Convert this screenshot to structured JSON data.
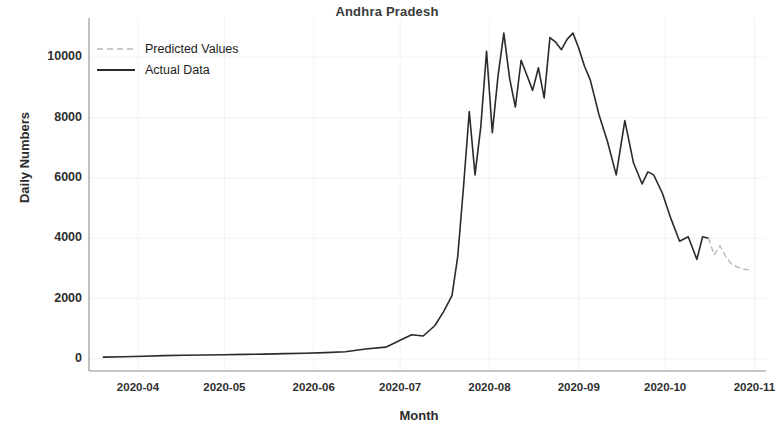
{
  "chart_data": {
    "type": "line",
    "title": "Andhra Pradesh",
    "xlabel": "Month",
    "ylabel": "Daily Numbers",
    "grid": true,
    "legend_position": "upper left",
    "ylim": [
      -400,
      11300
    ],
    "yticks": [
      0,
      2000,
      4000,
      6000,
      8000,
      10000
    ],
    "ytick_labels": [
      "0",
      "2000",
      "4000",
      "6000",
      "8000",
      "10000"
    ],
    "xlim": [
      "2020-03-15",
      "2020-11-05"
    ],
    "xticks": [
      "2020-04",
      "2020-05",
      "2020-06",
      "2020-07",
      "2020-08",
      "2020-09",
      "2020-10",
      "2020-11"
    ],
    "xtick_labels": [
      "2020-04",
      "2020-05",
      "2020-06",
      "2020-07",
      "2020-08",
      "2020-09",
      "2020-10",
      "2020-11"
    ],
    "colors": {
      "actual": "#2a2a2a",
      "predicted": "#b3b3b3",
      "axis": "#8d8d8d",
      "grid": "#f2f2f2"
    },
    "series": [
      {
        "name": "Actual Data",
        "style": "solid",
        "color": "#2a2a2a",
        "x": [
          "2020-03-20",
          "2020-03-27",
          "2020-04-03",
          "2020-04-10",
          "2020-04-17",
          "2020-04-24",
          "2020-05-01",
          "2020-05-08",
          "2020-05-15",
          "2020-05-22",
          "2020-05-29",
          "2020-06-05",
          "2020-06-12",
          "2020-06-19",
          "2020-06-26",
          "2020-07-01",
          "2020-07-05",
          "2020-07-09",
          "2020-07-13",
          "2020-07-16",
          "2020-07-19",
          "2020-07-21",
          "2020-07-23",
          "2020-07-25",
          "2020-07-27",
          "2020-07-29",
          "2020-07-31",
          "2020-08-02",
          "2020-08-04",
          "2020-08-06",
          "2020-08-08",
          "2020-08-10",
          "2020-08-12",
          "2020-08-14",
          "2020-08-16",
          "2020-08-18",
          "2020-08-20",
          "2020-08-22",
          "2020-08-24",
          "2020-08-26",
          "2020-08-28",
          "2020-08-30",
          "2020-09-01",
          "2020-09-03",
          "2020-09-05",
          "2020-09-08",
          "2020-09-11",
          "2020-09-14",
          "2020-09-17",
          "2020-09-20",
          "2020-09-23",
          "2020-09-25",
          "2020-09-27",
          "2020-09-30",
          "2020-10-03",
          "2020-10-06",
          "2020-10-09",
          "2020-10-12",
          "2020-10-14",
          "2020-10-16"
        ],
        "values": [
          60,
          70,
          90,
          110,
          120,
          130,
          140,
          150,
          160,
          175,
          190,
          210,
          240,
          330,
          390,
          620,
          800,
          760,
          1100,
          1550,
          2100,
          3400,
          5700,
          8200,
          6100,
          7700,
          10200,
          7500,
          9400,
          10800,
          9300,
          8350,
          9900,
          9400,
          8900,
          9650,
          8650,
          10650,
          10500,
          10250,
          10600,
          10800,
          10300,
          9700,
          9250,
          8100,
          7200,
          6100,
          7900,
          6500,
          5800,
          6200,
          6100,
          5500,
          4650,
          3900,
          4050,
          3300,
          4050,
          4000
        ]
      },
      {
        "name": "Predicted Values",
        "style": "dashed",
        "color": "#b3b3b3",
        "x": [
          "2020-10-16",
          "2020-10-18",
          "2020-10-20",
          "2020-10-22",
          "2020-10-24",
          "2020-10-26",
          "2020-10-28",
          "2020-10-30"
        ],
        "values": [
          4000,
          3450,
          3750,
          3400,
          3150,
          3050,
          2980,
          2950
        ]
      }
    ]
  },
  "legend": {
    "items": [
      {
        "label": "Predicted Values",
        "style": "dashed"
      },
      {
        "label": "Actual Data",
        "style": "solid"
      }
    ]
  }
}
